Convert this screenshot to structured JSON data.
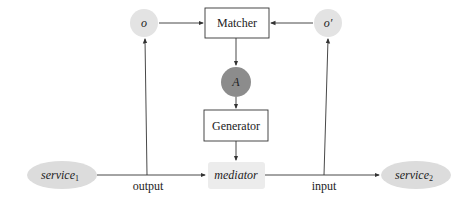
{
  "diagram": {
    "nodes": {
      "o": {
        "label": "o",
        "fill": "#e3e3e3"
      },
      "o_prime": {
        "label": "o′",
        "fill": "#e3e3e3"
      },
      "matcher": {
        "label": "Matcher"
      },
      "A": {
        "label": "A",
        "fill": "#8c8c8c"
      },
      "generator": {
        "label": "Generator"
      },
      "mediator": {
        "label": "mediator",
        "fill": "#ececec"
      },
      "service1": {
        "label": "service",
        "sub": "1",
        "fill": "#dcdcdc"
      },
      "service2": {
        "label": "service",
        "sub": "2",
        "fill": "#dcdcdc"
      }
    },
    "edges": {
      "output_label": "output",
      "input_label": "input"
    },
    "colors": {
      "line": "#333333",
      "box_border": "#333333"
    }
  }
}
